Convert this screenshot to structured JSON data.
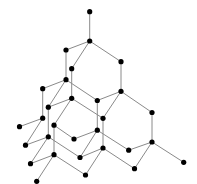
{
  "diagram": {
    "type": "graph",
    "style": {
      "node_color": "#000000",
      "edge_color": "#8a8a8a",
      "node_radius": 2.6,
      "background": "#ffffff"
    },
    "nodes": [
      {
        "id": 0,
        "x": 89.7,
        "y": 11.7
      },
      {
        "id": 1,
        "x": 89.7,
        "y": 41.0
      },
      {
        "id": 2,
        "x": 66.0,
        "y": 50.0
      },
      {
        "id": 3,
        "x": 71.7,
        "y": 68.7
      },
      {
        "id": 4,
        "x": 121.0,
        "y": 61.7
      },
      {
        "id": 5,
        "x": 66.0,
        "y": 79.7
      },
      {
        "id": 6,
        "x": 121.0,
        "y": 91.3
      },
      {
        "id": 7,
        "x": 42.7,
        "y": 88.7
      },
      {
        "id": 8,
        "x": 71.7,
        "y": 98.3
      },
      {
        "id": 9,
        "x": 97.3,
        "y": 100.5
      },
      {
        "id": 10,
        "x": 48.3,
        "y": 107.2
      },
      {
        "id": 11,
        "x": 152.0,
        "y": 112.5
      },
      {
        "id": 12,
        "x": 42.7,
        "y": 118.2
      },
      {
        "id": 13,
        "x": 103.0,
        "y": 118.3
      },
      {
        "id": 14,
        "x": 19.5,
        "y": 126.7
      },
      {
        "id": 15,
        "x": 54.0,
        "y": 125.2
      },
      {
        "id": 16,
        "x": 97.3,
        "y": 130.2
      },
      {
        "id": 17,
        "x": 48.3,
        "y": 136.8
      },
      {
        "id": 18,
        "x": 74.0,
        "y": 139.0
      },
      {
        "id": 19,
        "x": 152.0,
        "y": 142.0
      },
      {
        "id": 20,
        "x": 25.5,
        "y": 145.2
      },
      {
        "id": 21,
        "x": 103.0,
        "y": 148.0
      },
      {
        "id": 22,
        "x": 128.7,
        "y": 150.2
      },
      {
        "id": 23,
        "x": 54.0,
        "y": 154.7
      },
      {
        "id": 24,
        "x": 80.0,
        "y": 157.5
      },
      {
        "id": 25,
        "x": 183.7,
        "y": 162.3
      },
      {
        "id": 26,
        "x": 30.5,
        "y": 163.7
      },
      {
        "id": 27,
        "x": 134.5,
        "y": 168.7
      },
      {
        "id": 28,
        "x": 85.5,
        "y": 175.0
      },
      {
        "id": 29,
        "x": 36.7,
        "y": 181.3
      }
    ],
    "edges": [
      [
        0,
        1
      ],
      [
        1,
        2
      ],
      [
        1,
        3
      ],
      [
        1,
        4
      ],
      [
        2,
        5
      ],
      [
        3,
        8
      ],
      [
        4,
        6
      ],
      [
        5,
        7
      ],
      [
        5,
        10
      ],
      [
        5,
        9
      ],
      [
        6,
        9
      ],
      [
        6,
        11
      ],
      [
        6,
        13
      ],
      [
        7,
        12
      ],
      [
        8,
        10
      ],
      [
        8,
        15
      ],
      [
        8,
        13
      ],
      [
        9,
        16
      ],
      [
        10,
        17
      ],
      [
        11,
        19
      ],
      [
        12,
        14
      ],
      [
        12,
        20
      ],
      [
        13,
        21
      ],
      [
        15,
        18
      ],
      [
        15,
        23
      ],
      [
        16,
        18
      ],
      [
        16,
        24
      ],
      [
        16,
        22
      ],
      [
        17,
        20
      ],
      [
        17,
        26
      ],
      [
        17,
        24
      ],
      [
        19,
        22
      ],
      [
        19,
        27
      ],
      [
        19,
        25
      ],
      [
        21,
        24
      ],
      [
        21,
        28
      ],
      [
        21,
        27
      ],
      [
        23,
        26
      ],
      [
        23,
        29
      ],
      [
        23,
        28
      ]
    ]
  }
}
